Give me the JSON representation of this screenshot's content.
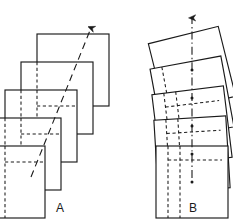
{
  "figure": {
    "type": "line-diagram",
    "width": 233,
    "height": 223,
    "background_color": "#ffffff",
    "stroke_color": "#1a1a1a",
    "hidden_edge_color": "#1a1a1a"
  },
  "panels": [
    {
      "id": "A",
      "label": "A",
      "label_x": 60,
      "label_y": 212,
      "transformation": "translation",
      "arrow_kind": "dashed-diagonal-arrow",
      "arrow_label": "",
      "square_count": 5,
      "square_size": 72,
      "step_dx": -16,
      "step_dy": 28,
      "first_square_x": 37,
      "first_square_y": 34,
      "rotation_deg": 0,
      "axis": {
        "style": "dashed",
        "x1": 31,
        "y1": 175,
        "x2": 92,
        "y2": 26,
        "arrowhead": "filled-triangle",
        "arrowhead_at": "end"
      }
    },
    {
      "id": "B",
      "label": "B",
      "label_x": 193,
      "label_y": 212,
      "transformation": "rotation",
      "arrow_kind": "dash-dot-vertical-axis-arrow",
      "arrow_label": "",
      "square_count": 5,
      "square_size": 72,
      "step_dy": 28,
      "first_square_cx": 192,
      "first_square_cy": 70,
      "rotation_start_deg": -14,
      "rotation_step_deg": 4,
      "axis": {
        "style": "dash-dot",
        "x1": 192,
        "y1": 175,
        "x2": 192,
        "y2": 16,
        "arrowhead": "filled-triangle",
        "arrowhead_at": "end",
        "center_markers": 5
      }
    }
  ],
  "icons": {
    "arrowhead": "arrowhead-triangle-icon"
  }
}
